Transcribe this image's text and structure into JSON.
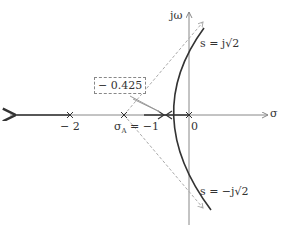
{
  "diagram": {
    "type": "root-locus",
    "axes": {
      "real_axis_label": "σ",
      "imag_axis_label": "jω"
    },
    "ticks": {
      "minus_two": "− 2",
      "zero": "0"
    },
    "asymptote_centroid": {
      "symbol": "σ",
      "subscript": "A",
      "text": " = −1"
    },
    "breakaway_point": "− 0.425",
    "crossings": {
      "upper": "s = j√2",
      "lower": "s = −j√2"
    },
    "colors": {
      "locus": "#333333",
      "axis": "#888888",
      "asymptote": "#aaaaaa"
    }
  }
}
